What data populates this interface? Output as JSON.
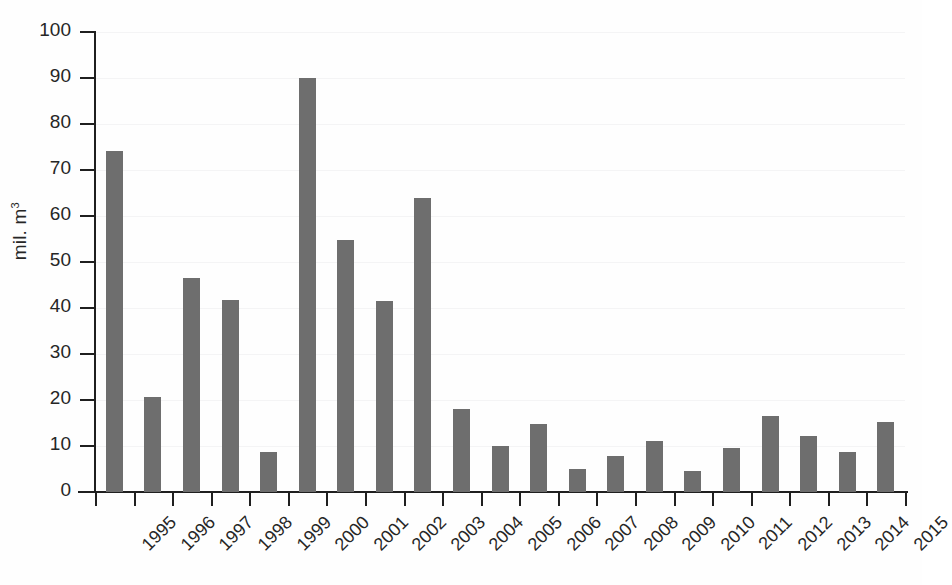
{
  "chart_data": {
    "type": "bar",
    "title": "",
    "subtitle": "",
    "xlabel": "",
    "ylabel": "mil. m",
    "ylabel_superscript": "3",
    "ylabel_full": "mil. m³",
    "categories": [
      "1995",
      "1996",
      "1997",
      "1998",
      "1999",
      "2000",
      "2001",
      "2002",
      "2003",
      "2004",
      "2005",
      "2006",
      "2007",
      "2008",
      "2009",
      "2010",
      "2011",
      "2012",
      "2013",
      "2014",
      "2015"
    ],
    "values": [
      74.2,
      20.7,
      46.6,
      41.7,
      8.8,
      90.0,
      54.8,
      41.5,
      64.0,
      18.0,
      10.0,
      14.7,
      5.0,
      7.8,
      11.0,
      4.5,
      9.5,
      16.5,
      12.1,
      8.8,
      15.3
    ],
    "ylim": [
      0,
      100
    ],
    "y_ticks": [
      0,
      10,
      20,
      30,
      40,
      50,
      60,
      70,
      80,
      90,
      100
    ],
    "y_tick_labels": [
      "0",
      "10",
      "20",
      "30",
      "40",
      "50",
      "60",
      "70",
      "80",
      "90",
      "100"
    ],
    "grid": true,
    "legend": false,
    "legend_position": "none",
    "series": [
      {
        "name": "",
        "values": [
          74.2,
          20.7,
          46.6,
          41.7,
          8.8,
          90.0,
          54.8,
          41.5,
          64.0,
          18.0,
          10.0,
          14.7,
          5.0,
          7.8,
          11.0,
          4.5,
          9.5,
          16.5,
          12.1,
          8.8,
          15.3
        ]
      }
    ],
    "colors": {
      "bar": "#6e6e6e",
      "axis": "#1f1f1f",
      "text": "#262626",
      "background": "#fefefe",
      "gridline": "#eeeef0"
    },
    "x_tick_label_rotation": -45
  }
}
